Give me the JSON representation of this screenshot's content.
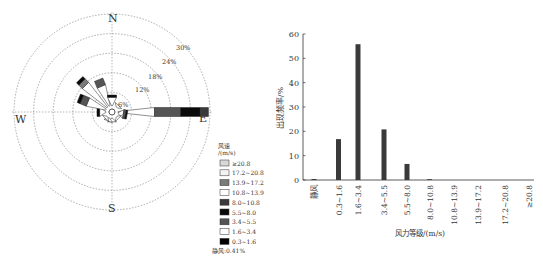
{
  "chart_data": [
    {
      "type": "wind-rose",
      "title": "",
      "compass": {
        "north": "N",
        "east": "E",
        "south": "S",
        "west": "W"
      },
      "rings": [
        6,
        12,
        18,
        24,
        30
      ],
      "ring_labels": [
        "6%",
        "12%",
        "18%",
        "24%",
        "30%"
      ],
      "legend_title": "风速",
      "legend_unit": "/(m/s)",
      "calm_label": "静风:0.41%",
      "legend": [
        {
          "label": "≥20.8",
          "color": "#d8d8d8"
        },
        {
          "label": "17.2~20.8",
          "color": "#f2f2f2"
        },
        {
          "label": "13.9~17.2",
          "color": "#7a7a7a"
        },
        {
          "label": "10.8~13.9",
          "color": "#ffffff"
        },
        {
          "label": "8.0~10.8",
          "color": "#3a3a3a"
        },
        {
          "label": "5.5~8.0",
          "color": "#0a0a0a"
        },
        {
          "label": "3.4~5.5",
          "color": "#555555"
        },
        {
          "label": "1.6~3.4",
          "color": "#ffffff"
        },
        {
          "label": "0.3~1.6",
          "color": "#000000"
        }
      ],
      "directions": [
        {
          "dir": "E",
          "angle": 90,
          "segments": [
            [
              "#ffffff",
              11
            ],
            [
              "#555555",
              8
            ],
            [
              "#0a0a0a",
              6
            ],
            [
              "#3a3a3a",
              2.5
            ]
          ]
        },
        {
          "dir": "ESE",
          "angle": 100,
          "segments": [
            [
              "#ffffff",
              1.5
            ],
            [
              "#555555",
              0.7
            ],
            [
              "#0a0a0a",
              0.5
            ]
          ]
        },
        {
          "dir": "W",
          "angle": 270,
          "segments": [
            [
              "#ffffff",
              1.8
            ],
            [
              "#0a0a0a",
              0.8
            ]
          ]
        },
        {
          "dir": "WNW",
          "angle": 292.5,
          "segments": [
            [
              "#ffffff",
              6
            ],
            [
              "#555555",
              2
            ],
            [
              "#0a0a0a",
              1
            ]
          ]
        },
        {
          "dir": "NW",
          "angle": 315,
          "segments": [
            [
              "#ffffff",
              9.5
            ],
            [
              "#7a7a7a",
              1.5
            ],
            [
              "#0a0a0a",
              1
            ]
          ]
        },
        {
          "dir": "NNW",
          "angle": 337.5,
          "segments": [
            [
              "#ffffff",
              6.5
            ],
            [
              "#555555",
              2.2
            ]
          ]
        },
        {
          "dir": "N",
          "angle": 0,
          "segments": [
            [
              "#ffffff",
              2.5
            ],
            [
              "#0a0a0a",
              0.7
            ]
          ]
        },
        {
          "dir": "S",
          "angle": 180,
          "segments": [
            [
              "#ffffff",
              1
            ]
          ]
        },
        {
          "dir": "SSW",
          "angle": 202.5,
          "segments": [
            [
              "#ffffff",
              1
            ]
          ]
        },
        {
          "dir": "SW",
          "angle": 225,
          "segments": [
            [
              "#ffffff",
              0.8
            ]
          ]
        },
        {
          "dir": "NE",
          "angle": 45,
          "segments": [
            [
              "#ffffff",
              0.8
            ]
          ]
        },
        {
          "dir": "SE",
          "angle": 135,
          "segments": [
            [
              "#ffffff",
              0.8
            ]
          ]
        }
      ]
    },
    {
      "type": "bar",
      "title": "",
      "xlabel": "风力等级/(m/s)",
      "ylabel": "出现频率/%",
      "ylim": [
        0,
        60
      ],
      "yticks": [
        0,
        10,
        20,
        30,
        40,
        50,
        60
      ],
      "categories": [
        "静风",
        "0.3~1.6",
        "1.6~3.4",
        "3.4~5.5",
        "5.5~8.0",
        "8.0~10.8",
        "10.8~13.9",
        "13.9~17.2",
        "17.2~20.8",
        "≥20.8"
      ],
      "values": [
        0.41,
        16.8,
        55.8,
        20.8,
        6.6,
        0.2,
        0,
        0,
        0,
        0
      ],
      "bar_color": "#3a3a3a",
      "grid": false
    }
  ]
}
